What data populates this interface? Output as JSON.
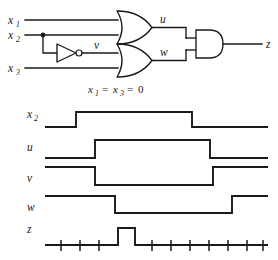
{
  "figure": {
    "kind": "logic-circuit-and-timing-diagram",
    "caption": {
      "var1": "x",
      "var1_sub": "1",
      "eq1": "=",
      "var2": "x",
      "var2_sub": "3",
      "eq2": "=",
      "value": "0",
      "full_text": "x1 = x3 = 0"
    }
  },
  "circuit": {
    "inputs": [
      {
        "name": "x",
        "subscript": "1",
        "label": "x1",
        "y": 20
      },
      {
        "name": "x",
        "subscript": "2",
        "label": "x2",
        "y": 35
      },
      {
        "name": "x",
        "subscript": "3",
        "label": "x3",
        "y": 68
      }
    ],
    "internal_signals": [
      {
        "name": "v",
        "label": "v",
        "source": "inverter"
      },
      {
        "name": "u",
        "label": "u",
        "source": "or-gate-top"
      },
      {
        "name": "w",
        "label": "w",
        "source": "or-gate-bottom"
      }
    ],
    "output": {
      "name": "z",
      "label": "z"
    },
    "gates": [
      {
        "id": "inverter",
        "type": "NOT",
        "inputs": [
          "x2"
        ],
        "output": "v"
      },
      {
        "id": "or-gate-top",
        "type": "OR",
        "inputs": [
          "x1",
          "x2"
        ],
        "output": "u"
      },
      {
        "id": "or-gate-bottom",
        "type": "OR",
        "inputs": [
          "v",
          "x3"
        ],
        "output": "w"
      },
      {
        "id": "and-gate-out",
        "type": "AND",
        "inputs": [
          "u",
          "w"
        ],
        "output": "z"
      }
    ],
    "junctions": [
      {
        "on": "x2",
        "x": 43,
        "y": 20
      }
    ]
  },
  "timing": {
    "signals": [
      {
        "label": "x",
        "subscript": "2",
        "name": "x2"
      },
      {
        "label": "u",
        "subscript": "",
        "name": "u"
      },
      {
        "label": "v",
        "subscript": "",
        "name": "v"
      },
      {
        "label": "w",
        "subscript": "",
        "name": "w"
      },
      {
        "label": "z",
        "subscript": "",
        "name": "z"
      }
    ],
    "waveform_levels": {
      "x2": [
        0,
        1,
        0
      ],
      "u": [
        0,
        1,
        0
      ],
      "v": [
        1,
        0,
        1
      ],
      "w": [
        1,
        0,
        1
      ],
      "z": [
        0,
        1,
        0
      ]
    },
    "z_glitch": "static-1-hazard-pulse",
    "tick_counts": {
      "before_pulse": 3,
      "after_pulse": 7
    }
  },
  "colors": {
    "ink": "#1a1a1a",
    "background": "#ffffff"
  }
}
